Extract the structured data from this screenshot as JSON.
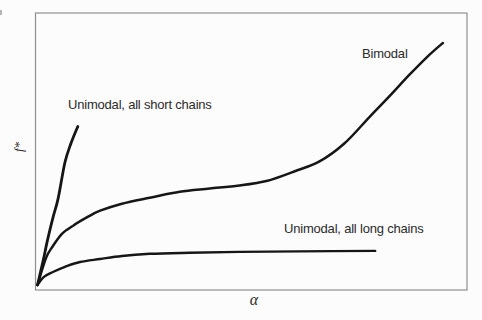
{
  "figure": {
    "background_color": "#fcfcfc",
    "frame_color": "#8f8f8f",
    "curve_color": "#161616",
    "label_color": "#2b2b2b"
  },
  "chart_data": {
    "type": "line",
    "title": "",
    "xlabel": "α",
    "ylabel": "f*",
    "axis_style": "closed rectangular frame, no tick marks, no numeric scale (schematic sketch)",
    "xlim": [
      0,
      1
    ],
    "ylim": [
      0,
      1
    ],
    "grid": false,
    "legend": "none — curves labeled inline with text annotations",
    "layout": {
      "frame": {
        "x": 35.5,
        "y": 13,
        "w": 431.5,
        "h": 277
      },
      "x0_px": 37.5,
      "x1_px": 466,
      "y0_px": 285,
      "y1_px": 14
    },
    "series": [
      {
        "id": "unimodal-short",
        "name": "Unimodal, all short chains",
        "stroke_width": 2.8,
        "description": "very steep rise from origin, ends mid-left of panel",
        "points": [
          [
            0,
            0
          ],
          [
            0.013,
            0.089
          ],
          [
            0.024,
            0.17
          ],
          [
            0.036,
            0.248
          ],
          [
            0.048,
            0.319
          ],
          [
            0.064,
            0.452
          ],
          [
            0.078,
            0.522
          ],
          [
            0.094,
            0.585
          ]
        ]
      },
      {
        "id": "bimodal",
        "name": "Bimodal",
        "stroke_width": 2.5,
        "description": "steep initial rise, long shallow plateau, then accelerating rise to top right",
        "points": [
          [
            0,
            0
          ],
          [
            0.02,
            0.1
          ],
          [
            0.036,
            0.144
          ],
          [
            0.057,
            0.189
          ],
          [
            0.083,
            0.219
          ],
          [
            0.118,
            0.252
          ],
          [
            0.146,
            0.274
          ],
          [
            0.197,
            0.3
          ],
          [
            0.262,
            0.322
          ],
          [
            0.332,
            0.344
          ],
          [
            0.402,
            0.356
          ],
          [
            0.471,
            0.367
          ],
          [
            0.537,
            0.385
          ],
          [
            0.599,
            0.419
          ],
          [
            0.658,
            0.456
          ],
          [
            0.716,
            0.522
          ],
          [
            0.774,
            0.619
          ],
          [
            0.821,
            0.696
          ],
          [
            0.867,
            0.774
          ],
          [
            0.909,
            0.841
          ],
          [
            0.946,
            0.893
          ]
        ]
      },
      {
        "id": "unimodal-long",
        "name": "Unimodal, all long chains",
        "stroke_width": 2.4,
        "description": "quick low saturation, then nearly flat low plateau ending mid-right",
        "points": [
          [
            0,
            0
          ],
          [
            0.015,
            0.03
          ],
          [
            0.036,
            0.048
          ],
          [
            0.064,
            0.067
          ],
          [
            0.099,
            0.085
          ],
          [
            0.146,
            0.096
          ],
          [
            0.197,
            0.107
          ],
          [
            0.262,
            0.115
          ],
          [
            0.355,
            0.119
          ],
          [
            0.471,
            0.122
          ],
          [
            0.611,
            0.124
          ],
          [
            0.788,
            0.126
          ]
        ]
      }
    ]
  }
}
